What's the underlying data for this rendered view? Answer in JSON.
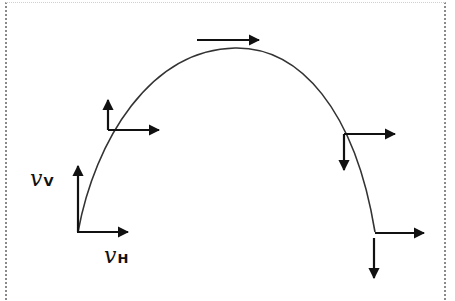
{
  "diagram": {
    "border_style": "dotted",
    "trajectory": {
      "type": "parabola",
      "start": [
        78,
        232
      ],
      "peak": [
        235,
        48
      ],
      "end": [
        375,
        232
      ],
      "color": "#333333"
    },
    "points": [
      {
        "name": "launch",
        "at": [
          78,
          232
        ],
        "vertical": {
          "dir": "up",
          "to": [
            78,
            165
          ]
        },
        "horizontal": {
          "dir": "right",
          "to": [
            128,
            232
          ]
        }
      },
      {
        "name": "rising",
        "at": [
          108,
          128
        ],
        "vertical": {
          "dir": "up",
          "to": [
            108,
            100
          ]
        },
        "horizontal": {
          "dir": "right",
          "to": [
            158,
            128
          ]
        }
      },
      {
        "name": "peak",
        "at": [
          227,
          40
        ],
        "vertical": null,
        "horizontal": {
          "dir": "right",
          "from": [
            197,
            40
          ],
          "to": [
            258,
            40
          ]
        }
      },
      {
        "name": "falling",
        "at": [
          343,
          130
        ],
        "vertical": {
          "dir": "down",
          "to": [
            343,
            170
          ]
        },
        "horizontal": {
          "dir": "right",
          "to": [
            395,
            130
          ]
        }
      },
      {
        "name": "landing",
        "at": [
          373,
          232
        ],
        "vertical": {
          "dir": "down",
          "to": [
            373,
            278
          ]
        },
        "horizontal": {
          "dir": "right",
          "to": [
            423,
            232
          ]
        }
      }
    ],
    "labels": {
      "vertical": {
        "symbol": "v",
        "subscript": "V"
      },
      "horizontal": {
        "symbol": "v",
        "subscript": "H"
      }
    },
    "colors": {
      "ink": "#111111",
      "curve": "#333333",
      "border": "#8a8a8a",
      "background": "#ffffff"
    }
  }
}
